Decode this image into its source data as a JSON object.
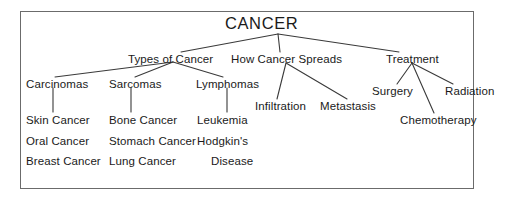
{
  "diagram": {
    "type": "tree-chart",
    "title": "CANCER",
    "border_color": "#6b6b6b",
    "text_color": "#1a1a1a",
    "nodes": {
      "root": "CANCER",
      "branch_types": "Types of Cancer",
      "branch_spreads": "How Cancer Spreads",
      "branch_treatment": "Treatment",
      "carcinomas": "Carcinomas",
      "sarcomas": "Sarcomas",
      "lymphomas": "Lymphomas",
      "infiltration": "Infiltration",
      "metastasis": "Metastasis",
      "surgery": "Surgery",
      "radiation": "Radiation",
      "chemotherapy": "Chemotherapy",
      "carcinoma_items": [
        "Skin Cancer",
        "Oral Cancer",
        "Breast Cancer"
      ],
      "sarcoma_items": [
        "Bone Cancer",
        "Stomach Cancer",
        "Lung Cancer"
      ],
      "lymphoma_items": [
        "Leukemia",
        "Hodgkin's",
        "Disease"
      ]
    }
  }
}
